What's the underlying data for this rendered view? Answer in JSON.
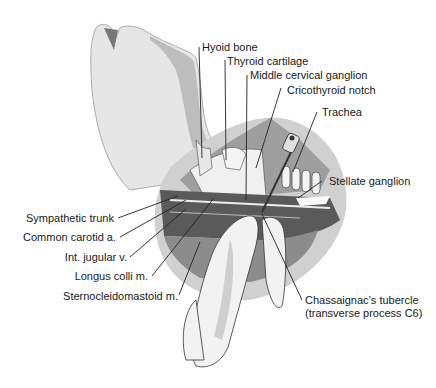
{
  "figure": {
    "labels": {
      "hyoid_bone": "Hyoid bone",
      "thyroid_cartilage": "Thyroid cartilage",
      "middle_cervical_ganglion": "Middle cervical ganglion",
      "cricothyroid_notch": "Cricothyroid notch",
      "trachea": "Trachea",
      "stellate_ganglion": "Stellate ganglion",
      "sympathetic_trunk": "Sympathetic trunk",
      "common_carotid": "Common carotid a.",
      "int_jugular": "Int. jugular v.",
      "longus_colli": "Longus colli m.",
      "sternocleidomastoid": "Sternocleidomastoid m.",
      "chassaignac_line1": "Chassaignac’s tubercle",
      "chassaignac_line2": "(transverse process C6)"
    },
    "colors": {
      "skin": "#e6e6e6",
      "skin_shadow": "#c8c8c8",
      "muscle_dark": "#5a5a5a",
      "muscle_mid": "#8c8c8c",
      "tissue_light": "#d2d2d2",
      "outline": "#2a2a2a"
    }
  }
}
